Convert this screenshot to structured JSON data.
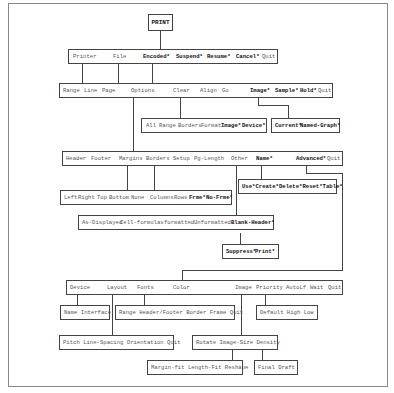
{
  "root": "PRINT",
  "row1": [
    {
      "label": "Printer",
      "bold": false
    },
    {
      "label": "File",
      "bold": false
    },
    {
      "label": "Encoded*",
      "bold": true
    },
    {
      "label": "Suspend*",
      "bold": true
    },
    {
      "label": "Resume*",
      "bold": true
    },
    {
      "label": "Cancel*",
      "bold": true
    },
    {
      "label": "Quit",
      "bold": false
    }
  ],
  "row2": [
    {
      "label": "Range",
      "bold": false
    },
    {
      "label": "Line",
      "bold": false
    },
    {
      "label": "Page",
      "bold": false
    },
    {
      "label": "Options",
      "bold": false
    },
    {
      "label": "Clear",
      "bold": false
    },
    {
      "label": "Align",
      "bold": false
    },
    {
      "label": "Go",
      "bold": false
    },
    {
      "label": "Image*",
      "bold": true
    },
    {
      "label": "Sample*",
      "bold": true
    },
    {
      "label": "Hold*",
      "bold": true
    },
    {
      "label": "Quit",
      "bold": false
    }
  ],
  "clear_menu": [
    {
      "label": "All",
      "bold": false
    },
    {
      "label": "Range",
      "bold": false
    },
    {
      "label": "Borders",
      "bold": false
    },
    {
      "label": "Format",
      "bold": false
    },
    {
      "label": "Image*",
      "bold": true
    },
    {
      "label": "Device*",
      "bold": true
    }
  ],
  "image_menu": [
    {
      "label": "Current*",
      "bold": true
    },
    {
      "label": "Named-Graph*",
      "bold": true
    }
  ],
  "options_menu": [
    {
      "label": "Header",
      "bold": false
    },
    {
      "label": "Footer",
      "bold": false
    },
    {
      "label": "Margins",
      "bold": false
    },
    {
      "label": "Borders",
      "bold": false
    },
    {
      "label": "Setup",
      "bold": false
    },
    {
      "label": "Pg-Length",
      "bold": false
    },
    {
      "label": "Other",
      "bold": false
    },
    {
      "label": "Name*",
      "bold": true
    },
    {
      "label": "Advanced*",
      "bold": true
    },
    {
      "label": "Quit",
      "bold": false
    }
  ],
  "margins_borders_menu": [
    {
      "label": "Left",
      "bold": false
    },
    {
      "label": "Right",
      "bold": false
    },
    {
      "label": "Top",
      "bold": false
    },
    {
      "label": "Bottom",
      "bold": false
    },
    {
      "label": "None",
      "bold": false
    },
    {
      "label": "Columns",
      "bold": false
    },
    {
      "label": "Rows",
      "bold": false
    },
    {
      "label": "Frme*",
      "bold": true
    },
    {
      "label": "No-Frme*",
      "bold": true
    }
  ],
  "name_menu": "Use*Create*Delete*Reset*Table*",
  "other_menu": [
    {
      "label": "As-Displayed",
      "bold": false
    },
    {
      "label": "Cell-formulas",
      "bold": false
    },
    {
      "label": "formatted",
      "bold": false
    },
    {
      "label": "Unformatted",
      "bold": false
    },
    {
      "label": "Blank-Header*",
      "bold": true
    }
  ],
  "blank_header_menu": [
    {
      "label": "Suppress*",
      "bold": true
    },
    {
      "label": "Print*",
      "bold": true
    }
  ],
  "advanced_menu": [
    {
      "label": "Device",
      "bold": false
    },
    {
      "label": "Layout",
      "bold": false
    },
    {
      "label": "Fonts",
      "bold": false
    },
    {
      "label": "Color",
      "bold": false
    },
    {
      "label": "Image",
      "bold": false
    },
    {
      "label": "Priority",
      "bold": false
    },
    {
      "label": "AutoLf",
      "bold": false
    },
    {
      "label": "Wait",
      "bold": false
    },
    {
      "label": "Quit",
      "bold": false
    }
  ],
  "device_menu": "Name Interface",
  "fonts_menu": "Range Header/Footer Border Frame Quit",
  "priority_menu": "Default  High  Low",
  "layout_menu": "Pitch Line-Spacing Orientation Quit",
  "adv_image_menu": "Rotate Image-Size Density",
  "image_size_menu": "Margin-fit Length-Fit Reshape",
  "density_menu": "Final  Draft"
}
